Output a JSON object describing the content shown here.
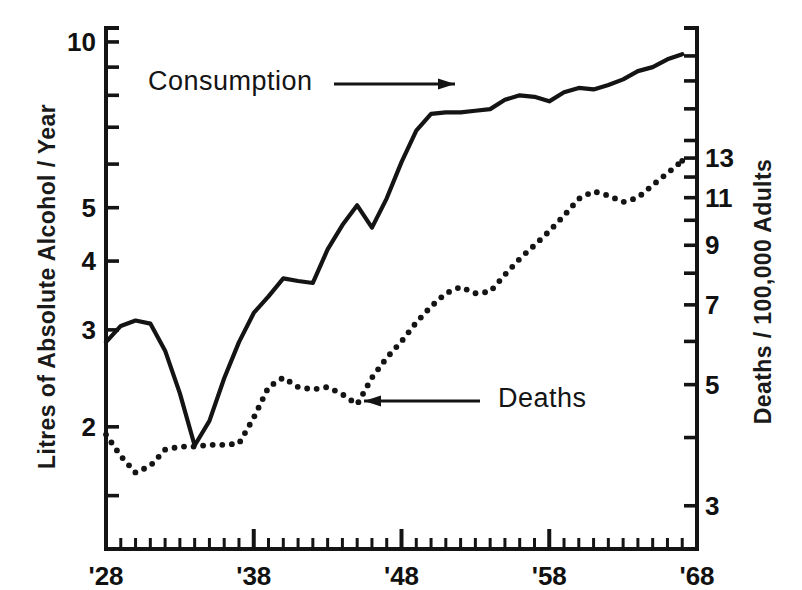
{
  "chart_data": {
    "type": "line",
    "title": "",
    "subtitle": "",
    "xlabel": "",
    "ylabel": "Litres of Absolute Alcohol / Year",
    "ylabel_right": "Deaths / 100,000 Adults",
    "xscale": "linear",
    "yscale": "log",
    "yscale_right": "log",
    "grid": false,
    "legend_position": "inline-annotations",
    "xlim": [
      1928,
      1968
    ],
    "ylim": [
      1.2,
      10.6
    ],
    "ylim_right": [
      2.5,
      22.5
    ],
    "xticks_major": [
      1928,
      1938,
      1948,
      1958,
      1968
    ],
    "xticklabels_major": [
      "'28",
      "'38",
      "'48",
      "'58",
      "'68"
    ],
    "xticks_minor_step": 1,
    "yticks_left": [
      2,
      3,
      4,
      5,
      6,
      7,
      8,
      9,
      10
    ],
    "yticklabels_left": [
      "2",
      "3",
      "4",
      "5",
      "",
      "",
      "",
      "",
      "10"
    ],
    "yticks_right": [
      3,
      4,
      5,
      6,
      7,
      8,
      9,
      10,
      11,
      12,
      13,
      14,
      16,
      18,
      20
    ],
    "yticklabels_right": [
      "3",
      "",
      "5",
      "",
      "7",
      "",
      "9",
      "",
      "11",
      "",
      "13",
      "",
      "",
      "",
      ""
    ],
    "annotations": [
      {
        "text": "Consumption",
        "series": "consumption",
        "arrow": "right",
        "x": 1931.0,
        "y": 7.6
      },
      {
        "text": "Deaths",
        "series": "deaths",
        "arrow": "left",
        "x": 1948.5,
        "y": 4.85
      }
    ],
    "series": [
      {
        "name": "Consumption",
        "style": "solid",
        "axis": "left",
        "unit": "Litres of Absolute Alcohol / Year",
        "x": [
          1928,
          1929,
          1930,
          1931,
          1932,
          1933,
          1934,
          1935,
          1936,
          1937,
          1938,
          1939,
          1940,
          1941,
          1942,
          1943,
          1944,
          1945,
          1946,
          1947,
          1948,
          1949,
          1950,
          1951,
          1952,
          1953,
          1954,
          1955,
          1956,
          1957,
          1958,
          1959,
          1960,
          1961,
          1962,
          1963,
          1964,
          1965,
          1966,
          1967
        ],
        "values": [
          2.85,
          3.05,
          3.12,
          3.08,
          2.75,
          2.3,
          1.85,
          2.05,
          2.45,
          2.85,
          3.22,
          3.45,
          3.72,
          3.68,
          3.65,
          4.2,
          4.65,
          5.05,
          4.6,
          5.2,
          6.05,
          6.9,
          7.4,
          7.45,
          7.45,
          7.5,
          7.55,
          7.85,
          8.0,
          7.95,
          7.8,
          8.1,
          8.25,
          8.2,
          8.35,
          8.55,
          8.85,
          9.0,
          9.3,
          9.5
        ]
      },
      {
        "name": "Deaths",
        "style": "dotted",
        "axis": "right",
        "unit": "Deaths / 100,000 Adults",
        "x": [
          1928,
          1929,
          1930,
          1931,
          1932,
          1933,
          1934,
          1935,
          1936,
          1937,
          1938,
          1939,
          1940,
          1941,
          1942,
          1943,
          1944,
          1945,
          1946,
          1947,
          1948,
          1949,
          1950,
          1951,
          1952,
          1953,
          1954,
          1955,
          1956,
          1957,
          1958,
          1959,
          1960,
          1961,
          1962,
          1963,
          1964,
          1965,
          1966,
          1967
        ],
        "values": [
          4.05,
          3.7,
          3.45,
          3.55,
          3.8,
          3.85,
          3.85,
          3.88,
          3.88,
          3.9,
          4.35,
          4.95,
          5.15,
          4.95,
          4.9,
          4.95,
          4.8,
          4.6,
          5.15,
          5.6,
          6.0,
          6.5,
          6.95,
          7.35,
          7.55,
          7.35,
          7.4,
          7.95,
          8.5,
          9.0,
          9.55,
          10.2,
          10.95,
          11.3,
          11.1,
          10.8,
          11.0,
          11.6,
          12.2,
          12.85
        ]
      }
    ]
  },
  "axes": {
    "left_title": "Litres of Absolute Alcohol / Year",
    "right_title": "Deaths / 100,000 Adults"
  },
  "labels": {
    "consumption": "Consumption",
    "deaths": "Deaths"
  }
}
